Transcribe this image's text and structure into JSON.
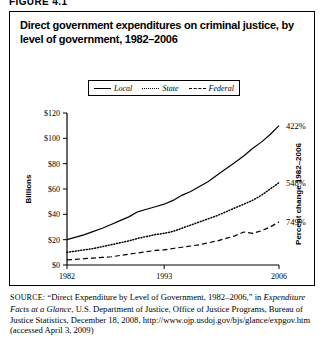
{
  "figure": {
    "number_label": "FIGURE 4.1",
    "title": "Direct government expenditures on criminal justice, by level of government, 1982–2006"
  },
  "legend": {
    "items": [
      {
        "label": "Local",
        "style": "solid",
        "color": "#000000"
      },
      {
        "label": "State",
        "style": "dotted",
        "color": "#000000"
      },
      {
        "label": "Federal",
        "style": "dashed",
        "color": "#000000"
      }
    ]
  },
  "axes": {
    "y_left_title": "Billions",
    "y_left_ticks": [
      "$0",
      "$20",
      "$40",
      "$60",
      "$80",
      "$100",
      "$120"
    ],
    "x_ticks": [
      "1982",
      "1993",
      "2006"
    ],
    "y_right_title": "Percent change 1982–2006"
  },
  "annotations": {
    "local_change": "422%",
    "state_change": "548%",
    "federal_change": "749%"
  },
  "source": {
    "prefix": "SOURCE:",
    "part1": " “Direct Expenditure by Level of Government, 1982–2006,” in ",
    "italic": "Expenditure Facts at a Glance",
    "part2": ", U.S. Department of Justice, Office of Justice Programs, Bureau of Justice Statistics, December 18, 2008, http://www.ojp.usdoj.gov/bjs/glance/expgov.htm (accessed April 3, 2009)"
  },
  "chart_data": {
    "type": "line",
    "title": "Direct government expenditures on criminal justice, by level of government, 1982–2006",
    "xlabel": "",
    "ylabel": "Billions",
    "xlim": [
      1982,
      2006
    ],
    "ylim": [
      0,
      120
    ],
    "ytick_values": [
      0,
      20,
      40,
      60,
      80,
      100,
      120
    ],
    "xtick_values": [
      1982,
      1993,
      2006
    ],
    "grid": false,
    "legend_position": "top-center",
    "x": [
      1982,
      1983,
      1984,
      1985,
      1986,
      1987,
      1988,
      1989,
      1990,
      1991,
      1992,
      1993,
      1994,
      1995,
      1996,
      1997,
      1998,
      1999,
      2000,
      2001,
      2002,
      2003,
      2004,
      2005,
      2006
    ],
    "series": [
      {
        "name": "Local",
        "style": "solid",
        "end_label": "422%",
        "values": [
          20.0,
          22.0,
          24.0,
          26.5,
          29.0,
          32.0,
          35.0,
          38.0,
          42.0,
          44.0,
          46.0,
          48.0,
          51.0,
          55.0,
          58.0,
          62.0,
          66.0,
          71.0,
          76.0,
          81.0,
          86.0,
          92.0,
          97.0,
          103.0,
          110.0
        ]
      },
      {
        "name": "State",
        "style": "dotted",
        "end_label": "548%",
        "values": [
          10.0,
          11.0,
          12.0,
          13.0,
          14.5,
          16.0,
          17.5,
          19.0,
          21.0,
          22.5,
          24.0,
          25.0,
          26.5,
          29.0,
          31.5,
          34.0,
          36.5,
          39.0,
          42.0,
          45.0,
          48.0,
          51.0,
          55.0,
          60.0,
          65.0
        ]
      },
      {
        "name": "Federal",
        "style": "dashed",
        "end_label": "749%",
        "values": [
          4.0,
          4.5,
          5.0,
          5.5,
          6.0,
          6.5,
          7.5,
          8.5,
          9.5,
          10.5,
          11.5,
          12.0,
          13.0,
          14.0,
          15.0,
          16.0,
          17.5,
          19.0,
          21.0,
          23.0,
          26.0,
          25.0,
          27.0,
          30.0,
          34.0
        ]
      }
    ]
  }
}
